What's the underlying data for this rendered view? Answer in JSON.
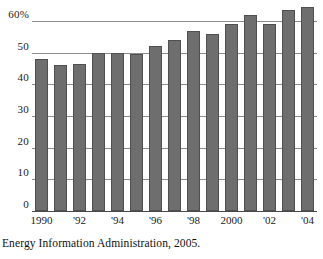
{
  "chart_data": {
    "type": "bar",
    "title": "",
    "subtitle": "",
    "xlabel": "",
    "ylabel": "",
    "categories": [
      "1990",
      "1991",
      "1992",
      "1993",
      "1994",
      "1995",
      "1996",
      "1997",
      "1998",
      "1999",
      "2000",
      "2001",
      "2002",
      "2003",
      "2004"
    ],
    "values": [
      48,
      46,
      46.5,
      50,
      50,
      49.5,
      52,
      54,
      57,
      56,
      59,
      62,
      59,
      63.5,
      64.5
    ],
    "series": [
      {
        "name": "",
        "values": [
          48,
          46,
          46.5,
          50,
          50,
          49.5,
          52,
          54,
          57,
          56,
          59,
          62,
          59,
          63.5,
          64.5
        ]
      }
    ],
    "ylim": [
      0,
      67
    ],
    "y_ticks": [
      0,
      10,
      20,
      30,
      40,
      50,
      60
    ],
    "y_tick_labels": [
      "0",
      "10",
      "20",
      "30",
      "40",
      "50",
      "60%"
    ],
    "x_tick_labels": [
      "1990",
      "'92",
      "'94",
      "'96",
      "'98",
      "2000",
      "'02",
      "'04"
    ],
    "x_tick_categories": [
      "1990",
      "1992",
      "1994",
      "1996",
      "1998",
      "2000",
      "2002",
      "2004"
    ],
    "grid": true,
    "grid_axis": "y",
    "legend": false,
    "legend_position": "none",
    "bar_color": "#6e6e6e",
    "bar_edge_color": "#4f4f4f",
    "grid_color": "#8c8c8c",
    "axis_color": "#4a4a4a",
    "annotations": []
  },
  "caption": {
    "source_note": "Energy Information Administration, 2005."
  }
}
